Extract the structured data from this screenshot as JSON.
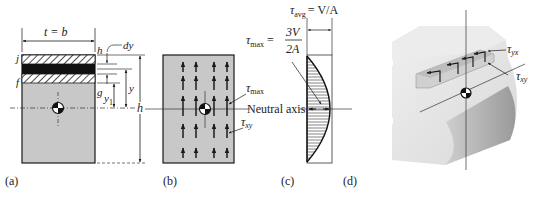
{
  "panels": {
    "a": {
      "caption": "(a)",
      "width_label": "t = b",
      "labels": {
        "j": "j",
        "f": "f",
        "h_top": "h",
        "g": "g",
        "dy": "dy",
        "y": "y",
        "y1": "y",
        "y1_sub": "1",
        "h": "h"
      }
    },
    "b": {
      "caption": "(b)",
      "tau": "τ",
      "tau_max_sub": "max",
      "tau_xy_sub": "xy",
      "neutral_axis": "Neutral axis"
    },
    "c": {
      "caption": "(c)",
      "tau_avg": "τ",
      "tau_avg_sub": "avg",
      "tau_avg_eq": "= V/A",
      "tau_max": "τ",
      "tau_max_sub": "max",
      "tau_max_eq": "=",
      "frac_num": "3V",
      "frac_den": "2A"
    },
    "d": {
      "caption": "(d)",
      "tau": "τ",
      "tau_yx_sub": "yx",
      "tau_xy_sub": "xy"
    }
  },
  "colors": {
    "section_fill": "#c8c8c8",
    "block_light": "#e6e6e6",
    "block_shadow": "#a9a9a9",
    "ink": "#1a1a1a"
  }
}
